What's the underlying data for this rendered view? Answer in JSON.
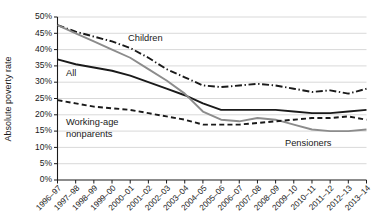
{
  "chart_data": {
    "type": "line",
    "title": "",
    "xlabel": "",
    "ylabel": "Absolute poverty rate",
    "ylim": [
      0,
      50
    ],
    "ytick_values": [
      0,
      5,
      10,
      15,
      20,
      25,
      30,
      35,
      40,
      45,
      50
    ],
    "ytick_labels": [
      "0%",
      "5%",
      "10%",
      "15%",
      "20%",
      "25%",
      "30%",
      "35%",
      "40%",
      "45%",
      "50%"
    ],
    "grid": true,
    "legend_position": "inline-annotations",
    "categories": [
      "1996–97",
      "1997–98",
      "1998–99",
      "1999–00",
      "2000–01",
      "2001–02",
      "2002–03",
      "2003–04",
      "2004–05",
      "2005–06",
      "2006–07",
      "2007–08",
      "2008–09",
      "2009–10",
      "2010–11",
      "2011–12",
      "2012–13",
      "2013–14"
    ],
    "series": [
      {
        "name": "Children",
        "style": "dash-dot",
        "color": "#1a1a1a",
        "label_text": "Children",
        "values": [
          47.5,
          45.5,
          44.0,
          42.5,
          40.5,
          37.5,
          34.0,
          31.5,
          29.0,
          28.5,
          29.0,
          29.5,
          29.0,
          28.0,
          27.0,
          27.5,
          26.5,
          28.0
        ]
      },
      {
        "name": "All",
        "style": "solid",
        "color": "#1a1a1a",
        "label_text": "All",
        "values": [
          37.0,
          35.5,
          34.5,
          33.5,
          32.0,
          30.0,
          28.0,
          26.0,
          23.5,
          21.5,
          21.5,
          21.5,
          21.5,
          21.0,
          20.5,
          20.5,
          21.0,
          21.5
        ]
      },
      {
        "name": "Pensioners",
        "style": "solid",
        "color": "#8c8c8c",
        "label_text": "Pensioners",
        "values": [
          47.5,
          45.0,
          42.5,
          40.0,
          37.5,
          34.0,
          30.5,
          26.5,
          21.0,
          18.5,
          18.0,
          19.0,
          18.5,
          17.0,
          15.5,
          15.0,
          15.0,
          15.5
        ]
      },
      {
        "name": "Working-age nonparents",
        "style": "dashed",
        "color": "#1a1a1a",
        "label_text": "Working-age\nnonparents",
        "values": [
          24.5,
          23.5,
          22.5,
          22.0,
          21.5,
          20.5,
          19.5,
          18.5,
          17.0,
          17.0,
          17.0,
          17.5,
          18.0,
          18.5,
          19.0,
          19.0,
          19.5,
          18.5
        ]
      }
    ],
    "annotations": [
      {
        "text": "Children",
        "x_px": 128,
        "y_px": 41
      },
      {
        "text": "All",
        "x_px": 66,
        "y_px": 76
      },
      {
        "text": "Working-age",
        "x_px": 66,
        "y_px": 125
      },
      {
        "text": "nonparents",
        "x_px": 66,
        "y_px": 137
      },
      {
        "text": "Pensioners",
        "x_px": 285,
        "y_px": 146
      }
    ]
  }
}
